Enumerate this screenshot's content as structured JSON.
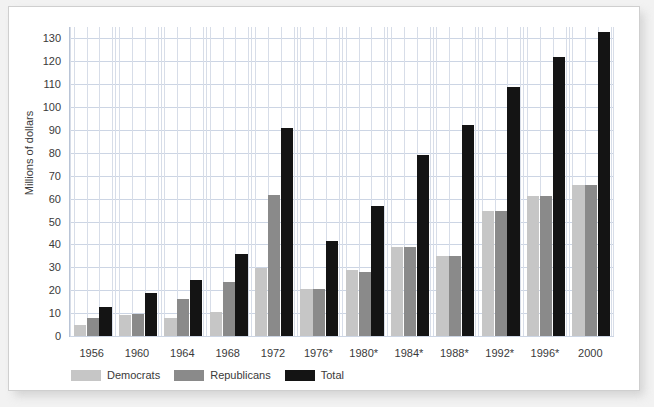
{
  "chart_data": {
    "type": "bar",
    "title": "",
    "subtitle": "",
    "xlabel": "",
    "ylabel": "Millions of dollars",
    "ylim": [
      0,
      135
    ],
    "ytick_step": 10,
    "yticks": [
      0,
      10,
      20,
      30,
      40,
      50,
      60,
      70,
      80,
      90,
      100,
      110,
      120,
      130
    ],
    "grid": true,
    "legend_position": "bottom-left",
    "categories": [
      "1956",
      "1960",
      "1964",
      "1968",
      "1972",
      "1976*",
      "1980*",
      "1984*",
      "1988*",
      "1992*",
      "1996*",
      "2000"
    ],
    "series": [
      {
        "name": "Democrats",
        "color": "#c6c6c6",
        "values": [
          5,
          9,
          8,
          10.5,
          29.5,
          20.5,
          29,
          39,
          35,
          54.5,
          61,
          66
        ]
      },
      {
        "name": "Republicans",
        "color": "#8a8a8a",
        "values": [
          8,
          9.5,
          16,
          23.5,
          61.5,
          20.5,
          28,
          39,
          35,
          54.5,
          61,
          66
        ]
      },
      {
        "name": "Total",
        "color": "#141414",
        "values": [
          12.5,
          19,
          24.5,
          36,
          91,
          41.5,
          57,
          79,
          92,
          109,
          122,
          133
        ]
      }
    ]
  },
  "axis": {
    "y_title": "Millions of dollars"
  },
  "legend": {
    "items": [
      {
        "label": "Democrats",
        "color": "#c6c6c6"
      },
      {
        "label": "Republicans",
        "color": "#8a8a8a"
      },
      {
        "label": "Total",
        "color": "#141414"
      }
    ]
  },
  "colors": {
    "page_background": "#f2f2f2",
    "card_background": "#ffffff",
    "card_border": "#cfcfcf",
    "gridline": "#ccd5e4",
    "axis_line": "#b9c4d6",
    "text": "#3a3a3a"
  }
}
